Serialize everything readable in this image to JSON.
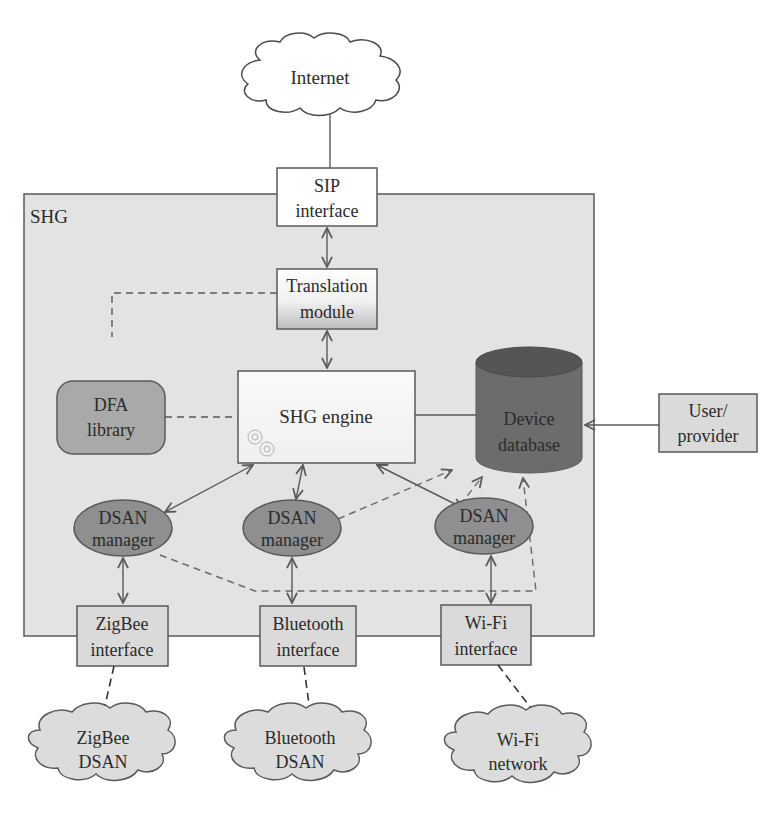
{
  "diagram": {
    "type": "architecture",
    "container": {
      "label": "SHG"
    },
    "nodes": {
      "internet": {
        "line1": "Internet"
      },
      "sip": {
        "line1": "SIP",
        "line2": "interface"
      },
      "translation": {
        "line1": "Translation",
        "line2": "module"
      },
      "engine": {
        "line1": "SHG engine"
      },
      "dfa": {
        "line1": "DFA",
        "line2": "library"
      },
      "database": {
        "line1": "Device",
        "line2": "database"
      },
      "user": {
        "line1": "User/",
        "line2": "provider"
      },
      "dsan_manager_1": {
        "line1": "DSAN",
        "line2": "manager"
      },
      "dsan_manager_2": {
        "line1": "DSAN",
        "line2": "manager"
      },
      "dsan_manager_3": {
        "line1": "DSAN",
        "line2": "manager"
      },
      "zigbee_if": {
        "line1": "ZigBee",
        "line2": "interface"
      },
      "bluetooth_if": {
        "line1": "Bluetooth",
        "line2": "interface"
      },
      "wifi_if": {
        "line1": "Wi-Fi",
        "line2": "interface"
      },
      "zigbee_net": {
        "line1": "ZigBee",
        "line2": "DSAN"
      },
      "bluetooth_net": {
        "line1": "Bluetooth",
        "line2": "DSAN"
      },
      "wifi_net": {
        "line1": "Wi-Fi",
        "line2": "network"
      }
    },
    "edges": [
      {
        "from": "Internet",
        "to": "SIP interface",
        "style": "solid"
      },
      {
        "from": "SIP interface",
        "to": "Translation module",
        "style": "solid-bidirectional"
      },
      {
        "from": "Translation module",
        "to": "SHG engine",
        "style": "solid-bidirectional"
      },
      {
        "from": "Translation module",
        "to": "DFA library",
        "style": "dashed"
      },
      {
        "from": "DFA library",
        "to": "SHG engine",
        "style": "dashed"
      },
      {
        "from": "SHG engine",
        "to": "Device database",
        "style": "solid"
      },
      {
        "from": "User/provider",
        "to": "Device database",
        "style": "solid-arrow"
      },
      {
        "from": "SHG engine",
        "to": "DSAN manager 1",
        "style": "solid-bidirectional"
      },
      {
        "from": "SHG engine",
        "to": "DSAN manager 2",
        "style": "solid-bidirectional"
      },
      {
        "from": "SHG engine",
        "to": "DSAN manager 3",
        "style": "solid-bidirectional"
      },
      {
        "from": "DSAN manager 1",
        "to": "Device database",
        "style": "dashed-arrow"
      },
      {
        "from": "DSAN manager 2",
        "to": "Device database",
        "style": "dashed-arrow"
      },
      {
        "from": "DSAN manager 3",
        "to": "Device database",
        "style": "dashed-arrow"
      },
      {
        "from": "DSAN manager 1",
        "to": "ZigBee interface",
        "style": "solid-bidirectional"
      },
      {
        "from": "DSAN manager 2",
        "to": "Bluetooth interface",
        "style": "solid-bidirectional"
      },
      {
        "from": "DSAN manager 3",
        "to": "Wi-Fi interface",
        "style": "solid-bidirectional"
      },
      {
        "from": "ZigBee interface",
        "to": "ZigBee DSAN",
        "style": "dashed"
      },
      {
        "from": "Bluetooth interface",
        "to": "Bluetooth DSAN",
        "style": "dashed"
      },
      {
        "from": "Wi-Fi interface",
        "to": "Wi-Fi network",
        "style": "dashed"
      }
    ],
    "colors": {
      "container_fill": "#e3e3e3",
      "box_fill": "#dadada",
      "white_box_fill": "#ffffff",
      "dfa_fill": "#a9a9a9",
      "dsan_fill": "#8f8f8f",
      "database_body": "#6c6c6c",
      "database_top": "#555555",
      "stroke": "#5a5a5a"
    }
  }
}
